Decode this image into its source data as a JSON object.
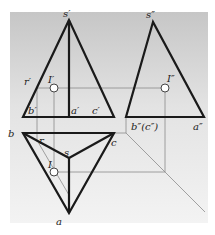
{
  "diagram": {
    "type": "three-view orthographic projection of triangular pyramid SABC with point I on face",
    "colors": {
      "background_top": "#c9c9c9",
      "background_bottom": "#f2f2f2",
      "outline": "#1a1a1a",
      "projection_line": "#8c8c8c",
      "point_fill": "#ffffff"
    },
    "labels": {
      "front": {
        "apex": "s′",
        "r": "r′",
        "point": "I′",
        "b": "b′",
        "a": "a′",
        "c": "c′"
      },
      "side": {
        "apex": "s″",
        "point": "I″",
        "bc": "b″(c″)",
        "a": "a″"
      },
      "top": {
        "b": "b",
        "r": "r",
        "s": "s",
        "point": "I",
        "c": "c",
        "a": "a"
      }
    }
  }
}
